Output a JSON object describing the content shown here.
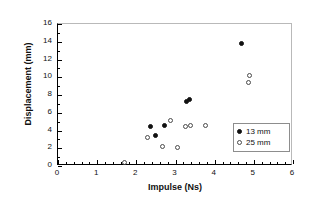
{
  "chart_data": {
    "type": "scatter",
    "title": "",
    "xlabel": "Impulse (Ns)",
    "ylabel": "Displacement (mm)",
    "xlim": [
      0,
      6
    ],
    "ylim": [
      0,
      16
    ],
    "xticks": [
      0,
      1,
      2,
      3,
      4,
      5,
      6
    ],
    "yticks": [
      0,
      2,
      4,
      6,
      8,
      10,
      12,
      14,
      16
    ],
    "xtick_labels": [
      "0",
      "1",
      "2",
      "3",
      "4",
      "5",
      "6"
    ],
    "ytick_labels": [
      "0",
      "2",
      "4",
      "6",
      "8",
      "10",
      "12",
      "14",
      "16"
    ],
    "grid": false,
    "legend_position": "lower right",
    "series": [
      {
        "name": "13 mm",
        "marker": "filled-circle",
        "color": "#111111",
        "points": [
          {
            "x": 2.35,
            "y": 4.45
          },
          {
            "x": 2.48,
            "y": 3.4
          },
          {
            "x": 2.73,
            "y": 4.6
          },
          {
            "x": 3.27,
            "y": 7.25
          },
          {
            "x": 3.37,
            "y": 7.5
          },
          {
            "x": 4.68,
            "y": 13.8
          }
        ]
      },
      {
        "name": "25 mm",
        "marker": "open-circle",
        "color": "#4a4a4a",
        "points": [
          {
            "x": 1.7,
            "y": 0.35
          },
          {
            "x": 2.29,
            "y": 3.2
          },
          {
            "x": 2.68,
            "y": 2.25
          },
          {
            "x": 2.88,
            "y": 5.1
          },
          {
            "x": 3.06,
            "y": 2.05
          },
          {
            "x": 3.25,
            "y": 4.5
          },
          {
            "x": 3.38,
            "y": 4.6
          },
          {
            "x": 3.77,
            "y": 4.55
          },
          {
            "x": 4.88,
            "y": 10.15
          },
          {
            "x": 4.86,
            "y": 9.4
          }
        ]
      }
    ]
  },
  "legend": {
    "entries": [
      {
        "label": "13 mm",
        "marker": "filled-circle"
      },
      {
        "label": "25 mm",
        "marker": "open-circle"
      }
    ]
  }
}
